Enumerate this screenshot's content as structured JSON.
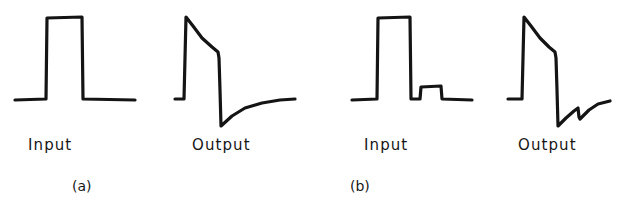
{
  "figure": {
    "background_color": "#ffffff",
    "ink_color": "#141414",
    "width": 620,
    "height": 204
  },
  "chart_data": {
    "type": "line",
    "title": "",
    "xlabel": "",
    "ylabel": "",
    "grid": false,
    "legend": "none",
    "panels": [
      {
        "id": "a",
        "caption": "(a)",
        "caption_x": 72,
        "caption_y": 179,
        "traces": [
          {
            "name": "Input",
            "label": "Input",
            "label_x": 28,
            "label_y": 138,
            "shape": "rectangular-pulse",
            "baseline_y": 99,
            "top_y": 17,
            "points": [
              [
                15,
                100
              ],
              [
                46,
                99
              ],
              [
                47,
                18
              ],
              [
                82,
                17
              ],
              [
                83,
                99
              ],
              [
                135,
                100
              ]
            ]
          },
          {
            "name": "Output",
            "label": "Output",
            "label_x": 192,
            "label_y": 138,
            "shape": "pulse-with-sag-and-undershoot",
            "baseline_y": 99,
            "top_y": 17,
            "undershoot_y": 126,
            "points": [
              [
                175,
                99
              ],
              [
                184,
                99
              ],
              [
                186,
                17
              ],
              [
                193,
                26
              ],
              [
                202,
                38
              ],
              [
                212,
                47
              ],
              [
                218,
                52
              ],
              [
                219,
                58
              ],
              [
                220,
                90
              ],
              [
                221,
                126
              ],
              [
                232,
                116
              ],
              [
                245,
                108
              ],
              [
                262,
                103
              ],
              [
                280,
                100
              ],
              [
                295,
                99
              ]
            ]
          }
        ]
      },
      {
        "id": "b",
        "caption": "(b)",
        "caption_x": 350,
        "caption_y": 179,
        "traces": [
          {
            "name": "Input",
            "label": "Input",
            "label_x": 364,
            "label_y": 138,
            "shape": "rectangular-pulse-plus-small-pulse",
            "baseline_y": 99,
            "top_y": 17,
            "small_pulse_top_y": 86,
            "points": [
              [
                352,
                100
              ],
              [
                377,
                99
              ],
              [
                378,
                18
              ],
              [
                410,
                17
              ],
              [
                411,
                99
              ],
              [
                420,
                99
              ],
              [
                421,
                87
              ],
              [
                441,
                86
              ],
              [
                442,
                99
              ],
              [
                472,
                100
              ]
            ]
          },
          {
            "name": "Output",
            "label": "Output",
            "label_x": 518,
            "label_y": 138,
            "shape": "pulse-with-sag-undershoot-and-notch",
            "baseline_y": 99,
            "top_y": 17,
            "undershoot_y": 126,
            "points": [
              [
                508,
                99
              ],
              [
                522,
                99
              ],
              [
                524,
                17
              ],
              [
                531,
                26
              ],
              [
                540,
                38
              ],
              [
                549,
                47
              ],
              [
                555,
                52
              ],
              [
                556,
                58
              ],
              [
                557,
                90
              ],
              [
                558,
                126
              ],
              [
                566,
                118
              ],
              [
                574,
                111
              ],
              [
                578,
                108
              ],
              [
                579,
                117
              ],
              [
                580,
                119
              ],
              [
                589,
                110
              ],
              [
                598,
                104
              ],
              [
                610,
                101
              ]
            ]
          }
        ]
      }
    ]
  }
}
